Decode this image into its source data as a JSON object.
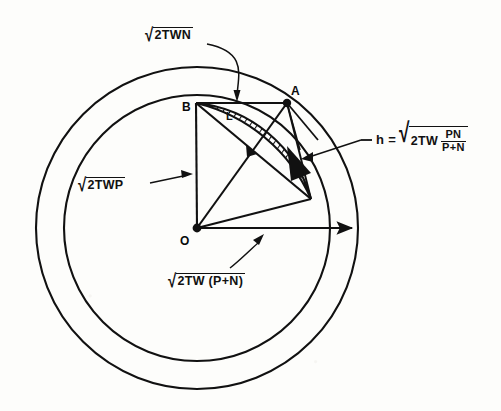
{
  "figure": {
    "points": {
      "origin_label": "O",
      "point_a_label": "A",
      "point_b_label": "B",
      "lens_label": "L"
    },
    "annotations": {
      "top": {
        "name": "sqrt-2TWN",
        "text": "√2TWN",
        "radicand": "2TWN",
        "radical": "√"
      },
      "left": {
        "name": "sqrt-2TWP",
        "text": "√2TWP",
        "radicand": "2TWP",
        "radical": "√"
      },
      "bottom": {
        "name": "sqrt-2TW-P-plus-N",
        "text": "√2TW (P+N)",
        "radicand": "2TW (P+N)",
        "radical": "√"
      },
      "right": {
        "name": "h-equation",
        "text": "h = √2TW PN/(P+N)",
        "lhs": "h =",
        "radical": "√",
        "radicand_lead": "2TW",
        "fraction_numerator": "PN",
        "fraction_denominator": "P+N"
      }
    },
    "geometry": {
      "center": {
        "x": 197,
        "y": 228
      },
      "outer_radius": 161,
      "inner_radius": 133,
      "point_a": {
        "x": 287,
        "y": 103
      },
      "point_b": {
        "x": 196,
        "y": 103
      },
      "lens_tip": {
        "x": 311,
        "y": 199
      }
    },
    "colors": {
      "ink": "#111111",
      "paper": "#fdfdfb",
      "hatch": "#111111"
    }
  }
}
